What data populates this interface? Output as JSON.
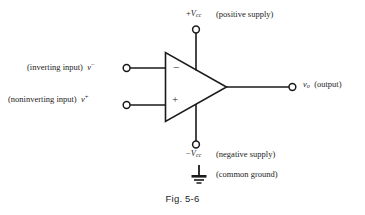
{
  "figure": {
    "caption": "Fig. 5-6",
    "line_color": "#1a1a1a",
    "background": "#ffffff",
    "text_color": "#1d1d1d"
  },
  "opamp": {
    "minus_sign": "−",
    "plus_sign": "+"
  },
  "labels": {
    "positive_supply": {
      "symbol_prefix": "+",
      "symbol_var": "V",
      "symbol_sub": "cc",
      "description": "(positive supply)"
    },
    "negative_supply": {
      "symbol_prefix": "−",
      "symbol_var": "V",
      "symbol_sub": "cc",
      "description": "(negative supply)"
    },
    "inverting_input": {
      "description": "(inverting input)",
      "symbol_var": "v",
      "symbol_sup": "−"
    },
    "noninverting_input": {
      "description": "(noninverting input)",
      "symbol_var": "v",
      "symbol_sup": "+"
    },
    "output": {
      "symbol_var": "v",
      "symbol_sub": "o",
      "description": "(output)"
    },
    "common_ground": {
      "description": "(common ground)"
    }
  }
}
